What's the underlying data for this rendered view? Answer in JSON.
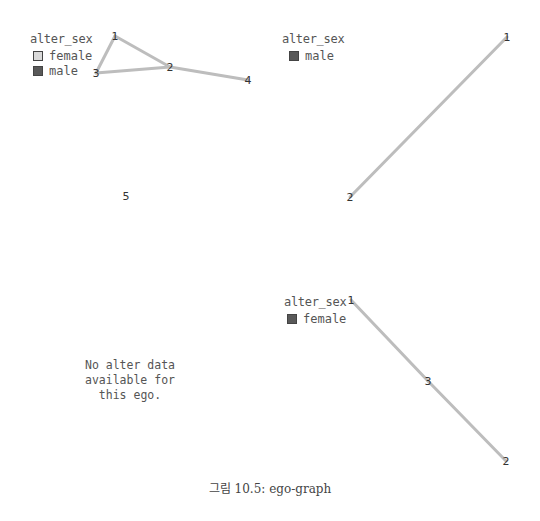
{
  "figure": {
    "caption": "그림 10.5: ego-graph"
  },
  "colors": {
    "edge": "#bdbdbd",
    "female_fill": "#d9d9d9",
    "male_fill": "#595959",
    "text": "#555555"
  },
  "panels": [
    {
      "id": "top-left",
      "legend": {
        "title": "alter_sex",
        "items": [
          {
            "label": "female",
            "color": "#d9d9d9"
          },
          {
            "label": "male",
            "color": "#595959"
          }
        ]
      },
      "nodes": [
        {
          "label": "1",
          "x": 115,
          "y": 36
        },
        {
          "label": "2",
          "x": 170,
          "y": 67
        },
        {
          "label": "3",
          "x": 96,
          "y": 73
        },
        {
          "label": "4",
          "x": 248,
          "y": 80
        },
        {
          "label": "5",
          "x": 126,
          "y": 196
        }
      ],
      "edges": [
        [
          0,
          1
        ],
        [
          0,
          2
        ],
        [
          2,
          1
        ],
        [
          1,
          3
        ]
      ]
    },
    {
      "id": "top-right",
      "legend": {
        "title": "alter_sex",
        "items": [
          {
            "label": "male",
            "color": "#595959"
          }
        ]
      },
      "nodes": [
        {
          "label": "1",
          "x": 507,
          "y": 37
        },
        {
          "label": "2",
          "x": 350,
          "y": 197
        }
      ],
      "edges": [
        [
          0,
          1
        ]
      ]
    },
    {
      "id": "bottom-left",
      "message": [
        "No alter data",
        "available for",
        "this ego."
      ]
    },
    {
      "id": "bottom-right",
      "legend": {
        "title": "alter_sex",
        "items": [
          {
            "label": "female",
            "color": "#595959"
          }
        ]
      },
      "nodes": [
        {
          "label": "1",
          "x": 351,
          "y": 300
        },
        {
          "label": "3",
          "x": 428,
          "y": 381
        },
        {
          "label": "2",
          "x": 506,
          "y": 461
        }
      ],
      "edges": [
        [
          0,
          1
        ],
        [
          1,
          2
        ]
      ]
    }
  ]
}
